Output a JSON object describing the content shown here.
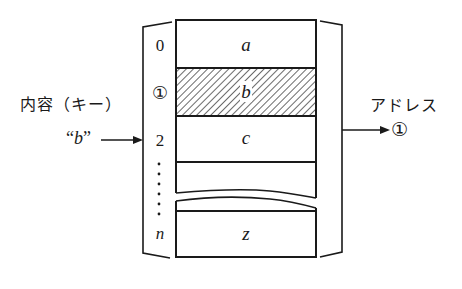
{
  "diagram": {
    "type": "hash-table-lookup",
    "table": {
      "rows": [
        {
          "index": "0",
          "content": "a",
          "highlighted": false
        },
        {
          "index": "①",
          "content": "b",
          "highlighted": true
        },
        {
          "index": "2",
          "content": "c",
          "highlighted": false
        },
        {
          "index": "",
          "content": "",
          "highlighted": false
        },
        {
          "index": "n",
          "content": "z",
          "highlighted": false
        }
      ],
      "ellipsis": "⋮"
    },
    "input": {
      "label": "内容（キー）",
      "value_open_quote": "“",
      "value": "b",
      "value_close_quote": "”"
    },
    "output": {
      "label": "アドレス",
      "value": "①"
    },
    "colors": {
      "line": "#1a1a1a",
      "background": "#ffffff"
    }
  }
}
